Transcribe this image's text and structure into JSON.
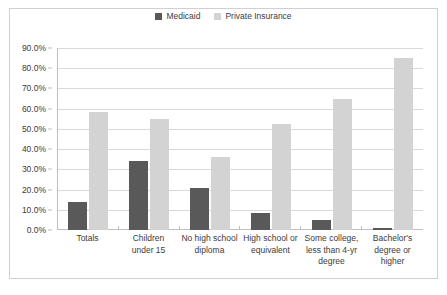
{
  "chart_data": {
    "type": "bar",
    "title": "",
    "subtitle": "",
    "xlabel": "",
    "ylabel": "",
    "ylim": [
      0,
      90
    ],
    "ytick_step": 10,
    "ytick_labels": [
      "90.0%",
      "80.0%",
      "70.0%",
      "60.0%",
      "50.0%",
      "40.0%",
      "30.0%",
      "20.0%",
      "10.0%",
      "0.0%"
    ],
    "ytick_values": [
      90,
      80,
      70,
      60,
      50,
      40,
      30,
      20,
      10,
      0
    ],
    "grid": true,
    "grid_axis": "y",
    "legend_position": "top-center",
    "categories": [
      "Totals",
      "Children under 15",
      "No high school diploma",
      "High school or equivalent",
      "Some college, less than 4-yr degree",
      "Bachelor's degree or higher"
    ],
    "category_lines": [
      [
        "Totals"
      ],
      [
        "Children",
        "under 15"
      ],
      [
        "No high school",
        "diploma"
      ],
      [
        "High school or",
        "equivalent"
      ],
      [
        "Some college,",
        "less than 4-yr",
        "degree"
      ],
      [
        "Bachelor's",
        "degree or",
        "higher"
      ]
    ],
    "series": [
      {
        "name": "Medicaid",
        "color": "#595959",
        "values": [
          14.0,
          34.0,
          21.0,
          8.5,
          5.0,
          1.0
        ]
      },
      {
        "name": "Private Insurance",
        "color": "#d3d3d3",
        "values": [
          58.5,
          55.0,
          36.0,
          52.5,
          65.0,
          85.0
        ]
      }
    ]
  },
  "style": {
    "plot_background": "#ffffff",
    "grid_color": "#d9d9d9",
    "axis_color": "#bfbfbf",
    "frame_color": "#d0d0d0",
    "text_color": "#3b3b3b"
  }
}
